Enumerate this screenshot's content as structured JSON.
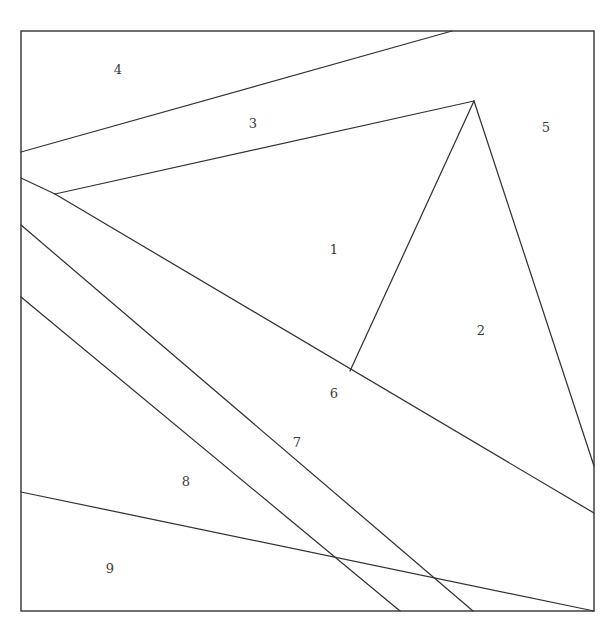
{
  "figure": {
    "canvas": {
      "width": 613,
      "height": 632
    },
    "stroke_color": "#333333",
    "background_color": "#ffffff",
    "label_color": "#3a3a3a",
    "border": {
      "name": "outer-square",
      "left": 21,
      "top": 31,
      "right": 594,
      "bottom": 611,
      "stroke_width": 1.4
    },
    "vertices": {
      "top_right_apex": {
        "x": 452,
        "y": 31
      },
      "fan_junction": {
        "x": 474,
        "y": 101
      },
      "inner_spur_end": {
        "x": 350,
        "y": 371
      },
      "left_junction": {
        "x": 55,
        "y": 194
      },
      "left_edge_a": {
        "x": 21,
        "y": 152
      },
      "left_edge_b": {
        "x": 21,
        "y": 178
      },
      "left_edge_c": {
        "x": 21,
        "y": 225
      },
      "left_edge_d": {
        "x": 21,
        "y": 297
      },
      "left_edge_e": {
        "x": 21,
        "y": 492
      },
      "right_edge_a": {
        "x": 594,
        "y": 466
      },
      "right_edge_b": {
        "x": 594,
        "y": 513
      },
      "bottom_a": {
        "x": 400,
        "y": 611
      },
      "bottom_b": {
        "x": 473,
        "y": 611
      }
    },
    "segments": [
      {
        "name": "seg-4-3-divider",
        "x1": 21,
        "y1": 152,
        "x2": 452,
        "y2": 31
      },
      {
        "name": "seg-3-1-divider",
        "x1": 55,
        "y1": 194,
        "x2": 474,
        "y2": 101
      },
      {
        "name": "seg-left-b-to-junction",
        "x1": 21,
        "y1": 178,
        "x2": 55,
        "y2": 194
      },
      {
        "name": "seg-1-6-long-diagonal",
        "x1": 55,
        "y1": 194,
        "x2": 594,
        "y2": 513
      },
      {
        "name": "seg-fan-to-right-edge",
        "x1": 474,
        "y1": 101,
        "x2": 594,
        "y2": 466
      },
      {
        "name": "seg-fan-to-spur",
        "x1": 474,
        "y1": 101,
        "x2": 350,
        "y2": 371
      },
      {
        "name": "seg-7-divider",
        "x1": 21,
        "y1": 225,
        "x2": 473,
        "y2": 611
      },
      {
        "name": "seg-8-divider",
        "x1": 21,
        "y1": 297,
        "x2": 400,
        "y2": 611
      },
      {
        "name": "seg-9-divider",
        "x1": 21,
        "y1": 492,
        "x2": 594,
        "y2": 611
      }
    ],
    "labels": [
      {
        "id": "region-1",
        "text": "1",
        "x": 334,
        "y": 249
      },
      {
        "id": "region-2",
        "text": "2",
        "x": 481,
        "y": 330
      },
      {
        "id": "region-3",
        "text": "3",
        "x": 253,
        "y": 123
      },
      {
        "id": "region-4",
        "text": "4",
        "x": 118,
        "y": 69
      },
      {
        "id": "region-5",
        "text": "5",
        "x": 546,
        "y": 127
      },
      {
        "id": "region-6",
        "text": "6",
        "x": 334,
        "y": 393
      },
      {
        "id": "region-7",
        "text": "7",
        "x": 297,
        "y": 442
      },
      {
        "id": "region-8",
        "text": "8",
        "x": 186,
        "y": 481
      },
      {
        "id": "region-9",
        "text": "9",
        "x": 110,
        "y": 568
      }
    ]
  }
}
